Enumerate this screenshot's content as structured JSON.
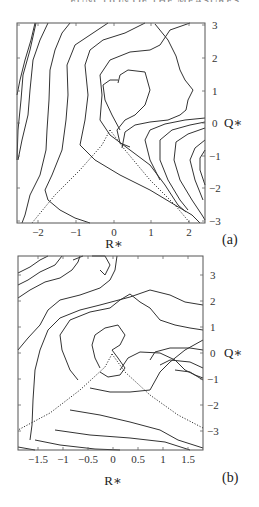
{
  "header": {
    "cropped_text": "FUNCTION OF THE MEASURES"
  },
  "chart_data": [
    {
      "type": "contour",
      "panel_label": "(a)",
      "xlabel": "R∗",
      "ylabel": "Q∗",
      "xlim": [
        -2.5,
        2.45
      ],
      "ylim": [
        -3.05,
        3.0
      ],
      "xticks": [
        -2,
        -1,
        0,
        1,
        2
      ],
      "xtick_labels": [
        "−2",
        "−1",
        "0",
        "1",
        "2"
      ],
      "yticks": [
        3,
        2,
        1,
        0,
        -1,
        -2,
        -3
      ],
      "ytick_labels": [
        "3",
        "2",
        "1",
        "0",
        "−1",
        "−2",
        "−3"
      ],
      "yaxis_position": "right",
      "annotations": [
        "dotted Vieillefosse tail lines from (0,0) apex to lower-left and lower-right"
      ],
      "frame": {
        "x": 17,
        "y": 23,
        "w": 188,
        "h": 200
      },
      "dotted_lines": [
        [
          [
            110,
            130
          ],
          [
            102,
            145
          ],
          [
            80,
            170
          ],
          [
            55,
            195
          ],
          [
            32,
            223
          ]
        ],
        [
          [
            110,
            130
          ],
          [
            125,
            150
          ],
          [
            150,
            180
          ],
          [
            175,
            205
          ],
          [
            190,
            223
          ]
        ]
      ],
      "contours": [
        [
          [
            17,
            95
          ],
          [
            20,
            80
          ],
          [
            25,
            60
          ],
          [
            31,
            40
          ],
          [
            35,
            23
          ]
        ],
        [
          [
            36,
            23
          ],
          [
            30,
            50
          ],
          [
            23,
            75
          ],
          [
            21,
            100
          ],
          [
            18,
            130
          ],
          [
            17,
            160
          ]
        ],
        [
          [
            48,
            23
          ],
          [
            40,
            40
          ],
          [
            33,
            60
          ],
          [
            30,
            90
          ],
          [
            28,
            115
          ],
          [
            22,
            140
          ],
          [
            18,
            160
          ]
        ],
        [
          [
            70,
            23
          ],
          [
            62,
            33
          ],
          [
            55,
            50
          ],
          [
            50,
            70
          ],
          [
            49,
            100
          ],
          [
            47,
            130
          ],
          [
            46,
            150
          ],
          [
            40,
            175
          ],
          [
            30,
            195
          ],
          [
            25,
            215
          ],
          [
            22,
            223
          ]
        ],
        [
          [
            108,
            23
          ],
          [
            90,
            35
          ],
          [
            75,
            45
          ],
          [
            67,
            65
          ],
          [
            68,
            95
          ],
          [
            66,
            120
          ],
          [
            62,
            150
          ],
          [
            52,
            175
          ],
          [
            45,
            190
          ],
          [
            48,
            200
          ],
          [
            60,
            210
          ],
          [
            75,
            218
          ],
          [
            90,
            223
          ]
        ],
        [
          [
            145,
            23
          ],
          [
            125,
            33
          ],
          [
            103,
            40
          ],
          [
            90,
            50
          ],
          [
            85,
            65
          ],
          [
            88,
            95
          ],
          [
            85,
            120
          ],
          [
            80,
            145
          ],
          [
            95,
            160
          ],
          [
            120,
            175
          ],
          [
            150,
            190
          ],
          [
            175,
            205
          ],
          [
            192,
            215
          ],
          [
            200,
            223
          ]
        ],
        [
          [
            190,
            23
          ],
          [
            170,
            30
          ],
          [
            160,
            45
          ],
          [
            150,
            50
          ],
          [
            130,
            52
          ],
          [
            110,
            60
          ],
          [
            100,
            75
          ],
          [
            102,
            95
          ],
          [
            100,
            120
          ],
          [
            110,
            135
          ],
          [
            130,
            150
          ],
          [
            150,
            165
          ],
          [
            165,
            185
          ],
          [
            178,
            205
          ],
          [
            186,
            212
          ]
        ],
        [
          [
            118,
            83
          ],
          [
            120,
            75
          ],
          [
            128,
            70
          ],
          [
            145,
            72
          ],
          [
            150,
            90
          ],
          [
            145,
            105
          ],
          [
            135,
            115
          ],
          [
            125,
            120
          ],
          [
            117,
            130
          ],
          [
            120,
            143
          ],
          [
            130,
            147
          ]
        ],
        [
          [
            120,
            130
          ],
          [
            112,
            115
          ],
          [
            105,
            100
          ],
          [
            103,
            85
          ],
          [
            110,
            80
          ],
          [
            118,
            80
          ]
        ],
        [
          [
            155,
            24
          ],
          [
            168,
            40
          ],
          [
            176,
            56
          ],
          [
            180,
            70
          ],
          [
            185,
            80
          ],
          [
            193,
            90
          ],
          [
            188,
            100
          ],
          [
            186,
            110
          ],
          [
            180,
            115
          ],
          [
            168,
            120
          ],
          [
            150,
            122
          ],
          [
            135,
            125
          ],
          [
            125,
            132
          ],
          [
            122,
            148
          ]
        ],
        [
          [
            205,
            118
          ],
          [
            185,
            120
          ],
          [
            165,
            124
          ],
          [
            150,
            130
          ],
          [
            145,
            140
          ],
          [
            150,
            160
          ],
          [
            160,
            180
          ]
        ],
        [
          [
            205,
            122
          ],
          [
            190,
            125
          ],
          [
            172,
            130
          ],
          [
            160,
            140
          ],
          [
            160,
            160
          ],
          [
            168,
            180
          ],
          [
            180,
            200
          ],
          [
            188,
            210
          ]
        ],
        [
          [
            205,
            128
          ],
          [
            188,
            134
          ],
          [
            176,
            142
          ],
          [
            174,
            160
          ],
          [
            180,
            180
          ],
          [
            192,
            200
          ],
          [
            202,
            215
          ],
          [
            205,
            220
          ]
        ],
        [
          [
            205,
            140
          ],
          [
            195,
            148
          ],
          [
            190,
            160
          ],
          [
            195,
            180
          ],
          [
            203,
            200
          ]
        ],
        [
          [
            205,
            150
          ],
          [
            200,
            158
          ],
          [
            200,
            170
          ],
          [
            205,
            185
          ]
        ]
      ]
    },
    {
      "type": "contour",
      "panel_label": "(b)",
      "xlabel": "R∗",
      "ylabel": "Q∗",
      "xlim": [
        -1.9,
        1.8
      ],
      "ylim": [
        -3.7,
        3.75
      ],
      "xticks": [
        -1.5,
        -1,
        -0.5,
        0,
        0.5,
        1,
        1.5
      ],
      "xtick_labels": [
        "−1.5",
        "−1",
        "−0.5",
        "0",
        "0.5",
        "1",
        "1.5"
      ],
      "yticks": [
        3,
        2,
        1,
        0,
        -1,
        -2,
        -3
      ],
      "ytick_labels": [
        "3",
        "2",
        "1",
        "0",
        "−1",
        "−2",
        "−3"
      ],
      "yaxis_position": "right",
      "annotations": [
        "dotted Vieillefosse tail lines from (0,0) apex to lower-left and lower-right"
      ],
      "frame": {
        "x": 18,
        "y": 6,
        "w": 185,
        "h": 194
      },
      "dotted_lines": [
        [
          [
            112,
            104
          ],
          [
            105,
            117
          ],
          [
            80,
            140
          ],
          [
            50,
            163
          ],
          [
            18,
            180
          ]
        ],
        [
          [
            112,
            104
          ],
          [
            125,
            122
          ],
          [
            150,
            145
          ],
          [
            178,
            165
          ],
          [
            203,
            178
          ]
        ]
      ],
      "contours": [
        [
          [
            18,
            23
          ],
          [
            30,
            17
          ],
          [
            40,
            10
          ],
          [
            48,
            6
          ]
        ],
        [
          [
            18,
            35
          ],
          [
            28,
            30
          ],
          [
            40,
            22
          ],
          [
            55,
            15
          ],
          [
            62,
            6
          ]
        ],
        [
          [
            18,
            48
          ],
          [
            30,
            40
          ],
          [
            45,
            32
          ],
          [
            60,
            28
          ],
          [
            72,
            20
          ],
          [
            78,
            12
          ],
          [
            80,
            6
          ]
        ],
        [
          [
            18,
            100
          ],
          [
            28,
            88
          ],
          [
            40,
            75
          ],
          [
            48,
            60
          ],
          [
            60,
            50
          ],
          [
            80,
            45
          ],
          [
            100,
            38
          ],
          [
            110,
            30
          ],
          [
            115,
            20
          ],
          [
            117,
            6
          ]
        ],
        [
          [
            30,
            190
          ],
          [
            32,
            175
          ],
          [
            33,
            150
          ],
          [
            35,
            120
          ],
          [
            40,
            100
          ],
          [
            48,
            80
          ],
          [
            60,
            68
          ],
          [
            80,
            60
          ],
          [
            100,
            55
          ],
          [
            130,
            47
          ],
          [
            150,
            40
          ],
          [
            170,
            45
          ],
          [
            185,
            52
          ],
          [
            203,
            55
          ]
        ],
        [
          [
            73,
            10
          ],
          [
            83,
            6
          ]
        ],
        [
          [
            92,
            6
          ],
          [
            105,
            6
          ],
          [
            110,
            15
          ],
          [
            105,
            25
          ],
          [
            100,
            20
          ]
        ],
        [
          [
            78,
            130
          ],
          [
            70,
            120
          ],
          [
            62,
            100
          ],
          [
            60,
            85
          ],
          [
            70,
            70
          ],
          [
            90,
            62
          ],
          [
            110,
            58
          ],
          [
            120,
            50
          ],
          [
            130,
            44
          ],
          [
            140,
            52
          ],
          [
            150,
            58
          ],
          [
            160,
            70
          ],
          [
            175,
            75
          ],
          [
            190,
            78
          ],
          [
            203,
            80
          ]
        ],
        [
          [
            100,
            118
          ],
          [
            95,
            108
          ],
          [
            92,
            95
          ],
          [
            95,
            85
          ],
          [
            105,
            78
          ],
          [
            118,
            75
          ],
          [
            125,
            85
          ],
          [
            120,
            95
          ],
          [
            112,
            100
          ],
          [
            118,
            108
          ],
          [
            125,
            118
          ],
          [
            120,
            125
          ],
          [
            108,
            127
          ],
          [
            100,
            122
          ]
        ],
        [
          [
            90,
            138
          ],
          [
            110,
            142
          ],
          [
            130,
            142
          ],
          [
            150,
            140
          ],
          [
            160,
            122
          ],
          [
            170,
            112
          ],
          [
            185,
            100
          ],
          [
            203,
            90
          ]
        ],
        [
          [
            120,
            120
          ],
          [
            128,
            108
          ],
          [
            140,
            102
          ],
          [
            160,
            103
          ],
          [
            175,
            110
          ],
          [
            185,
            120
          ],
          [
            195,
            125
          ],
          [
            203,
            128
          ]
        ],
        [
          [
            150,
            110
          ],
          [
            155,
            102
          ],
          [
            170,
            98
          ],
          [
            190,
            98
          ],
          [
            203,
            100
          ]
        ],
        [
          [
            160,
            115
          ],
          [
            170,
            110
          ],
          [
            190,
            112
          ],
          [
            203,
            118
          ]
        ],
        [
          [
            175,
            120
          ],
          [
            190,
            122
          ],
          [
            203,
            130
          ]
        ],
        [
          [
            70,
            160
          ],
          [
            100,
            165
          ],
          [
            130,
            172
          ],
          [
            160,
            180
          ],
          [
            178,
            190
          ],
          [
            203,
            198
          ]
        ],
        [
          [
            55,
            180
          ],
          [
            90,
            185
          ],
          [
            130,
            188
          ],
          [
            165,
            192
          ],
          [
            190,
            200
          ]
        ],
        [
          [
            35,
            190
          ],
          [
            60,
            195
          ],
          [
            95,
            199
          ],
          [
            120,
            200
          ]
        ],
        [
          [
            18,
            197
          ],
          [
            35,
            200
          ]
        ]
      ]
    }
  ],
  "axes_pixels": {
    "a": {
      "ytick_y": [
        25,
        58,
        91,
        123,
        156,
        188,
        221
      ],
      "xtick_x": [
        38,
        76,
        114,
        151,
        189
      ],
      "xtick_label_y": 236,
      "xlabel_pos": [
        114,
        248
      ],
      "ylabel_pos": [
        224,
        127
      ],
      "panel_label_pos": [
        222,
        244
      ]
    },
    "b": {
      "ytick_y": [
        25,
        51,
        77,
        103,
        129,
        155,
        181
      ],
      "xtick_x": [
        38,
        63,
        88,
        113,
        138,
        163,
        188
      ],
      "xtick_label_y": 213,
      "xlabel_pos": [
        113,
        235
      ],
      "ylabel_pos": [
        224,
        107
      ],
      "panel_label_pos": [
        222,
        232
      ]
    }
  }
}
